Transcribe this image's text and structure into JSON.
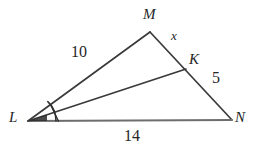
{
  "figure": {
    "kind": "geometry-diagram",
    "shape": "triangle-with-cevian",
    "background_color": "#ffffff",
    "stroke_color": "#3a3a3a",
    "baseline_color": "#6e6e6e",
    "label_color": "#262626",
    "width": 261,
    "height": 153
  },
  "vertices": {
    "M": {
      "label": "M",
      "x": 150,
      "y": 32
    },
    "L": {
      "label": "L",
      "x": 28,
      "y": 121
    },
    "N": {
      "label": "N",
      "x": 232,
      "y": 120
    },
    "K": {
      "label": "K",
      "x": 186,
      "y": 69
    }
  },
  "segments": [
    {
      "name": "LM",
      "from": "L",
      "to": "M",
      "measure": "10"
    },
    {
      "name": "MK",
      "from": "M",
      "to": "K",
      "measure": "x"
    },
    {
      "name": "KN",
      "from": "K",
      "to": "N",
      "measure": "5"
    },
    {
      "name": "LN",
      "from": "L",
      "to": "N",
      "measure": "14"
    },
    {
      "name": "LK",
      "from": "L",
      "to": "K",
      "measure": ""
    }
  ],
  "measures": {
    "side_LM": "10",
    "side_MK": "x",
    "side_KN": "5",
    "side_LN": "14"
  },
  "angle_marks": {
    "vertex": "L",
    "type": "congruent-angle-arcs",
    "count": 2,
    "meaning": "angle-bisector"
  }
}
